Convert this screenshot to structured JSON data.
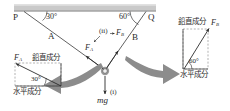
{
  "figure": {
    "ceiling": {
      "name": "ceiling-bar"
    },
    "anchors": {
      "left_label": "P",
      "right_label": "Q"
    },
    "ropes": {
      "left_name": "A",
      "right_name": "B",
      "left_angle": "30°",
      "right_angle": "60°"
    },
    "forces": {
      "fa_label": "F",
      "fa_sub": "A",
      "fb_label": "F",
      "fb_sub": "B",
      "weight_label": "mg"
    },
    "callouts": {
      "one": "(i)",
      "two": "(ii)"
    },
    "left_panel": {
      "name": "fa-decomposition",
      "force_label": "F",
      "force_sub": "A",
      "vertical_component": "鉛直成分",
      "horizontal_component": "水平成分",
      "angle": "30°"
    },
    "right_panel": {
      "name": "fb-decomposition",
      "force_label": "F",
      "force_sub": "B",
      "vertical_component": "鉛直成分",
      "horizontal_component": "水平成分",
      "angle": "60°"
    },
    "colors": {
      "ink": "#2b2b2b",
      "ceiling_fill": "#c9c9c9",
      "arrow_gray": "#8c8c8c",
      "line": "#3a3a3a",
      "dash": "#808080"
    }
  }
}
